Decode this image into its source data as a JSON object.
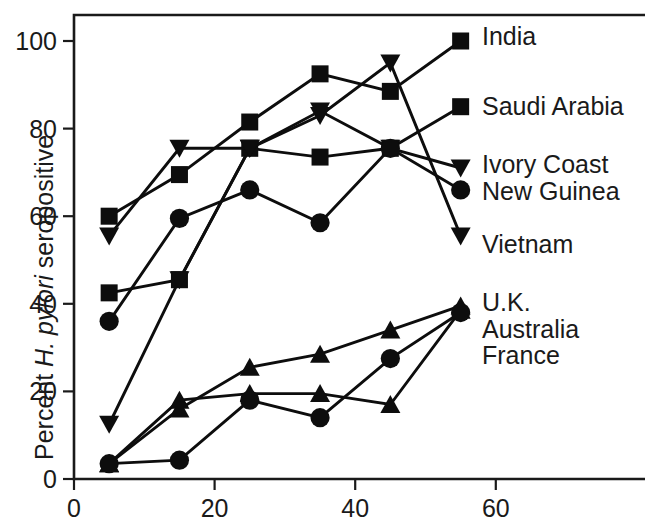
{
  "chart_data": {
    "type": "line",
    "title": "",
    "xlabel": "Age (yr)",
    "ylabel_parts": {
      "pre": "Percent ",
      "italic": "H. pylori",
      "post": " seropositive"
    },
    "ylabel": "Percent H. pylori seropositive",
    "xlim": [
      0,
      64
    ],
    "ylim": [
      0,
      107
    ],
    "xticks": [
      0,
      20,
      40,
      60
    ],
    "xticklabels": [
      "0",
      "20",
      "40",
      "60"
    ],
    "yticks": [
      0,
      20,
      40,
      60,
      80,
      100
    ],
    "yticklabels": [
      "0",
      "20",
      "40",
      "60",
      "80",
      "100"
    ],
    "grid": false,
    "legend_position": "right-inline-at-line-end",
    "x": [
      5,
      15,
      25,
      35,
      45,
      55
    ],
    "series": [
      {
        "name": "India",
        "marker": "square",
        "values": [
          60.0,
          69.5,
          81.5,
          92.5,
          88.5,
          100.0
        ]
      },
      {
        "name": "Saudi Arabia",
        "marker": "square",
        "values": [
          42.5,
          45.5,
          75.5,
          73.5,
          75.5,
          85.0
        ]
      },
      {
        "name": "Ivory Coast",
        "marker": "triangle-down",
        "values": [
          55.5,
          75.5,
          75.5,
          84.0,
          75.5,
          71.0
        ]
      },
      {
        "name": "New Guinea",
        "marker": "circle",
        "values": [
          36.0,
          59.5,
          66.0,
          58.5,
          75.5,
          66.0
        ]
      },
      {
        "name": "Vietnam",
        "marker": "triangle-down",
        "values": [
          12.5,
          45.5,
          75.5,
          83.0,
          95.0,
          55.5
        ]
      },
      {
        "name": "U.K.",
        "marker": "triangle-up",
        "values": [
          3.5,
          16.0,
          25.5,
          28.5,
          34.0,
          39.5
        ]
      },
      {
        "name": "Australia",
        "marker": "triangle-up",
        "values": [
          3.5,
          18.0,
          19.5,
          19.5,
          17.0,
          38.5
        ]
      },
      {
        "name": "France",
        "marker": "circle",
        "values": [
          3.5,
          4.3,
          18.0,
          14.0,
          27.5,
          38.0
        ]
      }
    ],
    "legend_entries": [
      {
        "label": "India",
        "marker": "square",
        "value": 100.0
      },
      {
        "label": "Saudi Arabia",
        "marker": "square",
        "value": 85.0
      },
      {
        "label": "Ivory Coast",
        "marker": "triangle-down",
        "value": 71.0
      },
      {
        "label": "New Guinea",
        "marker": "circle",
        "value": 66.0
      },
      {
        "label": "Vietnam",
        "marker": "triangle-down",
        "value": 55.5
      },
      {
        "label": "U.K.",
        "marker": "triangle-up",
        "value": 39.5
      },
      {
        "label": "Australia",
        "marker": "triangle-up",
        "value": 38.5
      },
      {
        "label": "France",
        "marker": "circle",
        "value": 38.0
      }
    ],
    "colors": {
      "ink": "#0d0d0d",
      "axis": "#1a1a1a",
      "background": "#ffffff"
    }
  }
}
